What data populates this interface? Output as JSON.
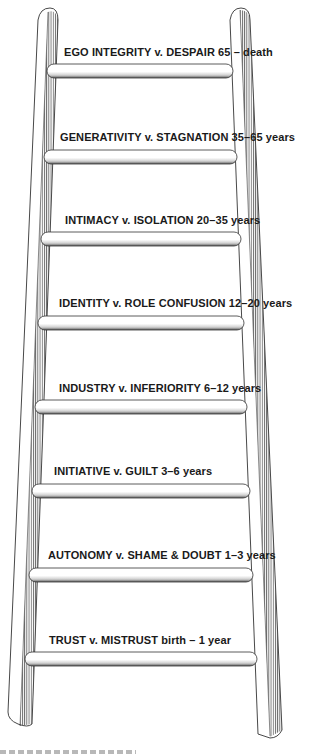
{
  "figure": {
    "type": "ladder-diagram",
    "colors": {
      "background": "#ffffff",
      "ink": "#1a1a1a",
      "rail_hatch": "#555555",
      "rung_fill": "#ffffff",
      "rung_shadow": "#6e6e6e"
    }
  },
  "stages": [
    {
      "conflict": "EGO INTEGRITY v. DESPAIR",
      "age": "65 – death"
    },
    {
      "conflict": "GENERATIVITY v. STAGNATION",
      "age": "35–65 years"
    },
    {
      "conflict": "INTIMACY v. ISOLATION",
      "age": "20–35 years"
    },
    {
      "conflict": "IDENTITY v. ROLE CONFUSION",
      "age": "12–20 years"
    },
    {
      "conflict": "INDUSTRY v. INFERIORITY",
      "age": "6–12 years"
    },
    {
      "conflict": "INITIATIVE v. GUILT",
      "age": "3–6 years"
    },
    {
      "conflict": "AUTONOMY v. SHAME & DOUBT",
      "age": "1–3 years"
    },
    {
      "conflict": "TRUST v. MISTRUST",
      "age": "birth – 1 year"
    }
  ]
}
